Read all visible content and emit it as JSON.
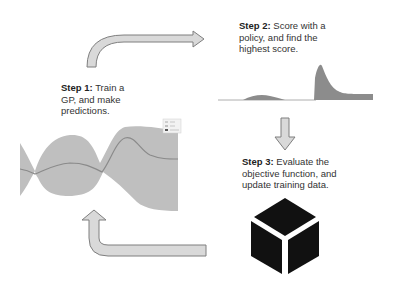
{
  "steps": [
    {
      "label": "Step 1:",
      "text_lines": [
        "Train a",
        "GP, and make",
        "predictions."
      ]
    },
    {
      "label": "Step 2:",
      "text_lines": [
        "Score with a",
        "policy, and find the",
        "highest score."
      ]
    },
    {
      "label": "Step 3:",
      "text_lines": [
        "Evaluate the",
        "objective function, and",
        "update training data."
      ]
    }
  ],
  "gp_chart": {
    "legend": [
      "data",
      "mean",
      "uncertainty"
    ],
    "colors": {
      "band": "#bfbfbf",
      "mean": "#8a8a8a"
    }
  },
  "acquisition_chart": {
    "color": "#8c8c8c"
  },
  "arrows": {
    "fill": "#d9d9d9",
    "stroke": "#7f7f7f"
  },
  "objective_icon": {
    "name": "black-box-cube",
    "color": "#111111"
  }
}
